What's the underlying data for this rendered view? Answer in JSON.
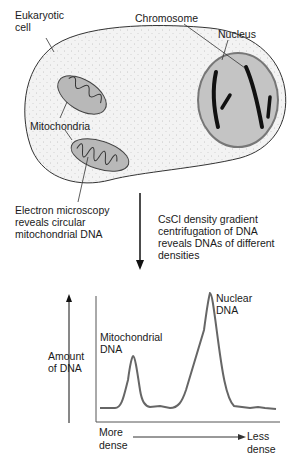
{
  "diagram": {
    "cell_labels": {
      "cell": [
        "Eukaryotic",
        "cell"
      ],
      "chromosome": "Chromosome",
      "nucleus": "Nucleus",
      "mitochondria": "Mitochondria",
      "electron_microscopy": [
        "Electron microscopy",
        "reveals circular",
        "mitochondrial DNA"
      ]
    },
    "process": [
      "CsCl density gradient",
      "centrifugation of DNA",
      "reveals DNAs of different",
      "densities"
    ],
    "colors": {
      "cell_fill": "#f2f2f2",
      "nucleus_fill": "#c4c4c4",
      "mito_fill": "#b8b8b8",
      "chromosome": "#111111",
      "line": "#333333",
      "trace": "#666666"
    }
  },
  "chart_data": {
    "type": "line",
    "title": "",
    "xlabel": [
      "More dense",
      "Less dense"
    ],
    "ylabel": [
      "Amount",
      "of DNA"
    ],
    "x_direction": "more dense -> less dense",
    "annotations": [
      {
        "label": [
          "Mitochondrial",
          "DNA"
        ],
        "peak_x": 0.2,
        "peak_y": 0.45
      },
      {
        "label": [
          "Nuclear",
          "DNA"
        ],
        "peak_x": 0.62,
        "peak_y": 1.0
      }
    ],
    "x": [
      0,
      0.1,
      0.15,
      0.2,
      0.25,
      0.3,
      0.35,
      0.4,
      0.45,
      0.5,
      0.55,
      0.62,
      0.68,
      0.75,
      0.85,
      0.95,
      1.0
    ],
    "values": [
      0.02,
      0.02,
      0.15,
      0.45,
      0.12,
      0.02,
      0.03,
      0.02,
      0.1,
      0.4,
      0.72,
      1.0,
      0.25,
      0.03,
      0.02,
      0.03,
      0.01
    ],
    "grid": false,
    "legend": "none"
  }
}
